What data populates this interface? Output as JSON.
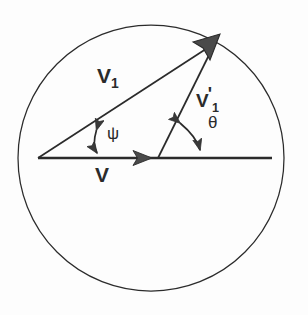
{
  "figure": {
    "type": "vector-diagram",
    "background_color": "#fdfdfd",
    "stroke_color": "#2b2b2b",
    "fill_color": "#4a4a4a"
  },
  "circle": {
    "name": "bounding-circle",
    "center_x": 151,
    "center_y": 158,
    "radius": 133,
    "stroke_color": "#2b2b2b",
    "stroke_width": 1.2,
    "fill": "none"
  },
  "vectors": [
    {
      "id": "v-axis",
      "label": "V",
      "label_text": "V",
      "description": "horizontal baseline vector along the x axis",
      "x1": 38,
      "y1": 158,
      "x2": 272,
      "y2": 158,
      "arrowhead_at_x": 150,
      "arrowhead_at_y": 158,
      "angle_deg": 0,
      "stroke_width": 2.6
    },
    {
      "id": "v1",
      "label": "V_1",
      "label_base": "V",
      "label_sub": "1",
      "description": "vector from origin to upper right tip, makes angle psi with horizontal",
      "x1": 38,
      "y1": 158,
      "x2": 216,
      "y2": 42,
      "angle_deg": 33,
      "stroke_width": 1.6
    },
    {
      "id": "v1-prime",
      "label": "V'_1",
      "label_base": "V",
      "label_prime": "'",
      "label_sub": "1",
      "description": "vector from midpoint of baseline to same upper right tip, makes angle theta with horizontal",
      "x1": 158,
      "y1": 158,
      "x2": 216,
      "y2": 42,
      "angle_deg": 63,
      "stroke_width": 1.6
    }
  ],
  "angles": [
    {
      "id": "psi",
      "symbol": "ψ",
      "label": "psi",
      "description": "angle between V_1 and the horizontal V axis, measured at the origin",
      "vertex_x": 38,
      "vertex_y": 158,
      "marker_x": 98,
      "marker_top_y": 125,
      "marker_bottom_y": 157,
      "label_x": 107,
      "label_y": 124,
      "double_headed": true
    },
    {
      "id": "theta",
      "symbol": "θ",
      "label": "theta",
      "description": "angle between V'_1 and the horizontal V axis, measured at the base of V'_1",
      "vertex_x": 158,
      "vertex_y": 158,
      "marker_radius": 48,
      "label_x": 208,
      "label_y": 113,
      "double_headed": true
    }
  ],
  "labels": {
    "v1": {
      "base": "V",
      "sub": "1"
    },
    "v1_prime": {
      "base": "V",
      "prime": "'",
      "sub": "1"
    },
    "v": {
      "base": "V"
    },
    "psi": {
      "symbol": "ψ"
    },
    "theta": {
      "symbol": "θ"
    }
  }
}
